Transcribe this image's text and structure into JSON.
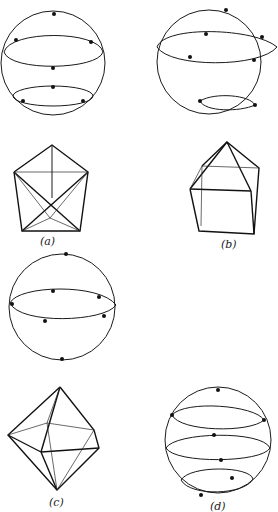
{
  "figure": {
    "panels": [
      {
        "id": "a",
        "label": "(a)",
        "polyhedron": "pentagonal figure (triangular bipyramid-like wireframe)",
        "sphere_points": 7,
        "circles_of_latitude": 2
      },
      {
        "id": "b",
        "label": "(b)",
        "polyhedron": "square pyramid on cube wireframe",
        "sphere_points": 7,
        "circles_of_latitude": 2
      },
      {
        "id": "c",
        "label": "(c)",
        "polyhedron": "octahedron-like wireframe",
        "sphere_points": 6,
        "circles_of_latitude": 1
      },
      {
        "id": "d",
        "label": "(d)",
        "polyhedron": null,
        "sphere_points": 7,
        "circles_of_latitude": 3
      }
    ],
    "colors": {
      "ink": "#111111",
      "background": "#ffffff"
    }
  }
}
